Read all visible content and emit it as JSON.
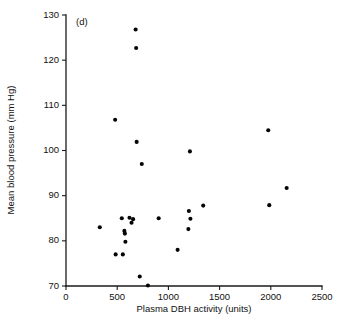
{
  "figure": {
    "panel_label": "(d)",
    "background_color": "#ffffff",
    "point_color": "#050505",
    "axis_color": "#1a1a1a"
  },
  "chart_data": {
    "type": "scatter",
    "title": "",
    "subtitle": "",
    "panel_label": "(d)",
    "xlabel": "Plasma DBH activity (units)",
    "ylabel": "Mean blood pressure (mm Hg)",
    "xlim": [
      0,
      2500
    ],
    "ylim": [
      70,
      130
    ],
    "xticks": [
      0,
      500,
      1000,
      1500,
      2000,
      2500
    ],
    "xtick_labels": [
      "0",
      "500",
      "1000",
      "1500",
      "2000",
      "2500"
    ],
    "yticks": [
      70,
      80,
      90,
      100,
      110,
      120,
      130
    ],
    "ytick_labels": [
      "70",
      "80",
      "90",
      "100",
      "110",
      "120",
      "130"
    ],
    "grid": false,
    "legend": null,
    "marker": "filled-circle",
    "marker_size": 4.1,
    "annotations": [],
    "points": [
      {
        "x": 330,
        "y": 83.0
      },
      {
        "x": 480,
        "y": 106.8
      },
      {
        "x": 485,
        "y": 77.0
      },
      {
        "x": 545,
        "y": 85.0
      },
      {
        "x": 555,
        "y": 77.0
      },
      {
        "x": 570,
        "y": 82.2
      },
      {
        "x": 575,
        "y": 81.6
      },
      {
        "x": 580,
        "y": 79.8
      },
      {
        "x": 620,
        "y": 85.1
      },
      {
        "x": 640,
        "y": 84.0
      },
      {
        "x": 655,
        "y": 84.8
      },
      {
        "x": 680,
        "y": 126.8
      },
      {
        "x": 685,
        "y": 122.7
      },
      {
        "x": 690,
        "y": 101.9
      },
      {
        "x": 720,
        "y": 72.1
      },
      {
        "x": 740,
        "y": 97.0
      },
      {
        "x": 800,
        "y": 70.1
      },
      {
        "x": 905,
        "y": 85.0
      },
      {
        "x": 1090,
        "y": 78.0
      },
      {
        "x": 1195,
        "y": 82.6
      },
      {
        "x": 1200,
        "y": 86.6
      },
      {
        "x": 1210,
        "y": 99.8
      },
      {
        "x": 1215,
        "y": 84.9
      },
      {
        "x": 1340,
        "y": 87.8
      },
      {
        "x": 1975,
        "y": 104.5
      },
      {
        "x": 1985,
        "y": 87.9
      },
      {
        "x": 2155,
        "y": 91.7
      }
    ]
  }
}
